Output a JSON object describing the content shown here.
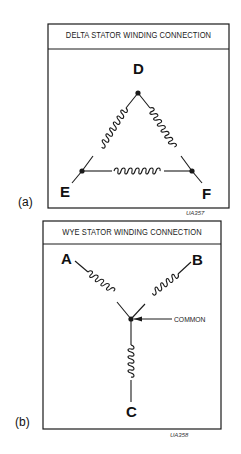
{
  "panels": [
    {
      "id": "a",
      "sub_label": "(a)",
      "title": "DELTA STATOR WINDING CONNECTION",
      "nodes": [
        "D",
        "E",
        "F"
      ],
      "code": "UA357"
    },
    {
      "id": "b",
      "sub_label": "(b)",
      "title": "WYE STATOR WINDING CONNECTION",
      "nodes": [
        "A",
        "B",
        "C"
      ],
      "common_label": "COMMON",
      "code": "UA358"
    }
  ],
  "colors": {
    "line": "#1a1a1a",
    "background": "#ffffff"
  }
}
